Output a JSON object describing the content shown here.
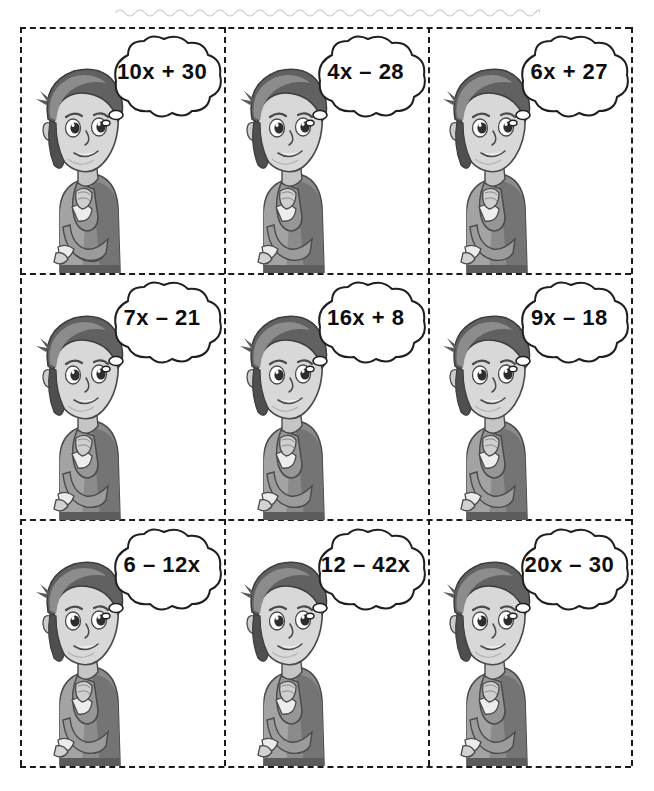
{
  "page": {
    "background_color": "#ffffff",
    "ink_color": "#1b1b1b",
    "card_border_style": "dashed",
    "grid": {
      "rows": 3,
      "columns": 3,
      "total_cards": 9
    }
  },
  "cut_line": {
    "name": "scissors-cut-wavy-line",
    "position": "top",
    "color": "#9a9a9a"
  },
  "cards": [
    {
      "id": "card-1",
      "row": 1,
      "column": 1,
      "expression": "10x + 30",
      "character": "thinking-boy"
    },
    {
      "id": "card-2",
      "row": 1,
      "column": 2,
      "expression": "4x – 28",
      "character": "thinking-boy"
    },
    {
      "id": "card-3",
      "row": 1,
      "column": 3,
      "expression": "6x + 27",
      "character": "thinking-boy"
    },
    {
      "id": "card-4",
      "row": 2,
      "column": 1,
      "expression": "7x – 21",
      "character": "thinking-boy"
    },
    {
      "id": "card-5",
      "row": 2,
      "column": 2,
      "expression": "16x + 8",
      "character": "thinking-boy"
    },
    {
      "id": "card-6",
      "row": 2,
      "column": 3,
      "expression": "9x – 18",
      "character": "thinking-boy"
    },
    {
      "id": "card-7",
      "row": 3,
      "column": 1,
      "expression": "6 – 12x",
      "character": "thinking-boy"
    },
    {
      "id": "card-8",
      "row": 3,
      "column": 2,
      "expression": "12 – 42x",
      "character": "thinking-boy"
    },
    {
      "id": "card-9",
      "row": 3,
      "column": 3,
      "expression": "20x – 30",
      "character": "thinking-boy"
    }
  ],
  "character_palette": {
    "hair_dark": "#4f4f4f",
    "hair_mid": "#6e6e6e",
    "hair_light": "#8d8d8d",
    "skin_light": "#dcdcdc",
    "skin_mid": "#c2c2c2",
    "skin_shadow": "#a8a8a8",
    "shirt_mid": "#8b8b8b",
    "shirt_dark": "#6a6a6a",
    "shirt_light": "#a5a5a5",
    "cuff": "#e8e8e8",
    "outline": "#3a3a3a"
  }
}
